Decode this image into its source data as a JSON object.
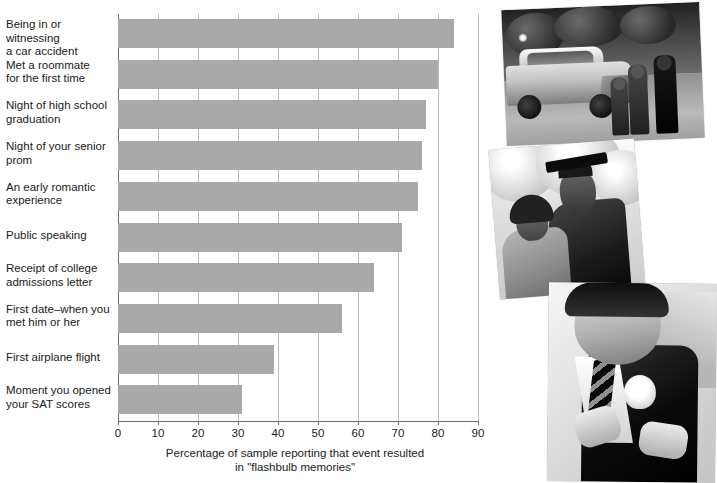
{
  "chart_data": {
    "type": "bar",
    "orientation": "horizontal",
    "title": "",
    "xlabel": "Percentage of sample reporting that event resulted in \"flashbulb memories\"",
    "ylabel": "",
    "xlim": [
      0,
      90
    ],
    "xticks": [
      0,
      10,
      20,
      30,
      40,
      50,
      60,
      70,
      80,
      90
    ],
    "grid": true,
    "legend": "none",
    "bar_color": "#a9a9a9",
    "categories": [
      "Being in or witnessing a car accident",
      "Met a roommate for the first time",
      "Night of high school graduation",
      "Night of your senior prom",
      "An early romantic experience",
      "Public speaking",
      "Receipt of college admissions letter",
      "First date–when you met him or her",
      "First airplane flight",
      "Moment you opened your SAT scores"
    ],
    "values": [
      84,
      80,
      77,
      76,
      75,
      71,
      64,
      56,
      39,
      31
    ]
  },
  "axis": {
    "x_title_line1": "Percentage of sample reporting that event resulted",
    "x_title_line2": "in \"flashbulb memories\"",
    "tick_labels": [
      "0",
      "10",
      "20",
      "30",
      "40",
      "50",
      "60",
      "70",
      "80",
      "90"
    ]
  },
  "category_labels": [
    {
      "line1": "Being in or witnessing",
      "line2": "a car accident"
    },
    {
      "line1": "Met a roommate",
      "line2": "for the first time"
    },
    {
      "line1": "Night of high school",
      "line2": "graduation"
    },
    {
      "line1": "Night of your senior",
      "line2": "prom"
    },
    {
      "line1": "An early romantic",
      "line2": "experience"
    },
    {
      "line1": "Public speaking",
      "line2": ""
    },
    {
      "line1": "Receipt of college",
      "line2": "admissions letter"
    },
    {
      "line1": "First date–when you",
      "line2": "met him or her"
    },
    {
      "line1": "First airplane flight",
      "line2": ""
    },
    {
      "line1": "Moment you opened",
      "line2": "your SAT scores"
    }
  ],
  "photos": [
    {
      "id": "photo-accident",
      "caption": "car accident scene with police and onlookers"
    },
    {
      "id": "photo-graduation",
      "caption": "graduate in cap and gown with family member"
    },
    {
      "id": "photo-prom",
      "caption": "young man in tuxedo receiving a boutonniere"
    }
  ]
}
